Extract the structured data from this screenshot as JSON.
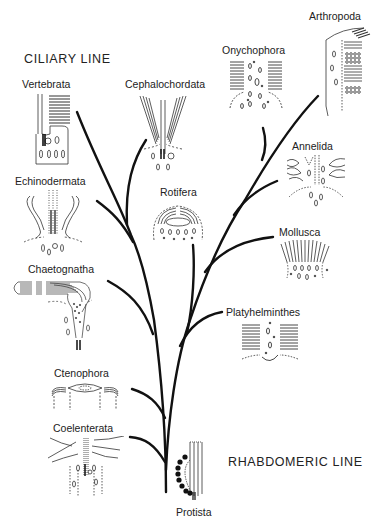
{
  "diagram": {
    "type": "phylogenetic-tree",
    "title_left": "CILIARY LINE",
    "title_right": "RHABDOMERIC LINE",
    "root": "Protista",
    "taxa": [
      {
        "name": "Vertebrata",
        "line": "ciliary"
      },
      {
        "name": "Cephalochordata",
        "line": "ciliary"
      },
      {
        "name": "Echinodermata",
        "line": "ciliary"
      },
      {
        "name": "Rotifera",
        "line": "rhabdomeric"
      },
      {
        "name": "Chaetognatha",
        "line": "ciliary"
      },
      {
        "name": "Ctenophora",
        "line": "ciliary"
      },
      {
        "name": "Coelenterata",
        "line": "ciliary"
      },
      {
        "name": "Onychophora",
        "line": "rhabdomeric"
      },
      {
        "name": "Arthropoda",
        "line": "rhabdomeric"
      },
      {
        "name": "Annelida",
        "line": "rhabdomeric"
      },
      {
        "name": "Mollusca",
        "line": "rhabdomeric"
      },
      {
        "name": "Platyhelminthes",
        "line": "rhabdomeric"
      },
      {
        "name": "Protista",
        "line": "root"
      }
    ],
    "stroke_color": "#111111"
  },
  "labels": {
    "ciliary": "CILIARY LINE",
    "rhabdomeric": "RHABDOMERIC LINE",
    "vertebrata": "Vertebrata",
    "cephalochordata": "Cephalochordata",
    "echinodermata": "Echinodermata",
    "rotifera": "Rotifera",
    "chaetognatha": "Chaetognatha",
    "ctenophora": "Ctenophora",
    "coelenterata": "Coelenterata",
    "onychophora": "Onychophora",
    "arthropoda": "Arthropoda",
    "annelida": "Annelida",
    "mollusca": "Mollusca",
    "platyhelminthes": "Platyhelminthes",
    "protista": "Protista"
  }
}
